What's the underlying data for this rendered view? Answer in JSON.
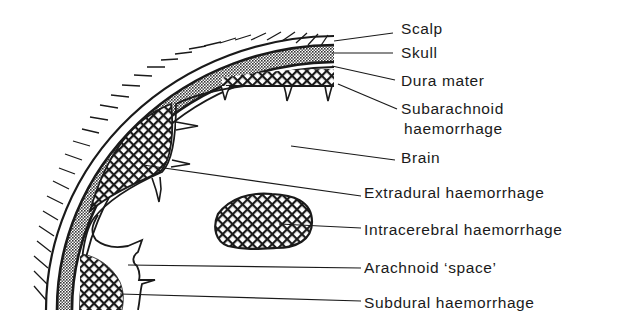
{
  "diagram": {
    "colors": {
      "ink": "#1a1a1a",
      "background": "#ffffff"
    },
    "labels": [
      {
        "id": "scalp",
        "text": "Scalp",
        "x": 401,
        "y": 19
      },
      {
        "id": "skull",
        "text": "Skull",
        "x": 401,
        "y": 43
      },
      {
        "id": "dura-mater",
        "text": "Dura mater",
        "x": 401,
        "y": 71
      },
      {
        "id": "subarachnoid",
        "text": "Subarachnoid",
        "x": 401,
        "y": 99
      },
      {
        "id": "subarachnoid-line2",
        "text": "haemorrhage",
        "x": 404,
        "y": 119
      },
      {
        "id": "brain",
        "text": "Brain",
        "x": 401,
        "y": 148
      },
      {
        "id": "extradural",
        "text": "Extradural haemorrhage",
        "x": 364,
        "y": 183
      },
      {
        "id": "intracerebral",
        "text": "Intracerebral haemorrhage",
        "x": 364,
        "y": 220
      },
      {
        "id": "arachnoid-space",
        "text": "Arachnoid ‘space’",
        "x": 364,
        "y": 258
      },
      {
        "id": "subdural",
        "text": "Subdural haemorrhage",
        "x": 364,
        "y": 293
      }
    ]
  }
}
